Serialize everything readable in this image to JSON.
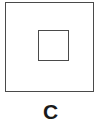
{
  "figure": {
    "caption": "C",
    "background_color": "#ffffff",
    "stroke_color": "#4a4a4a",
    "caption_color": "#1a1a1a",
    "shapes": [
      {
        "name": "outer-square",
        "type": "square",
        "x": 5,
        "y": 2,
        "width": 89,
        "height": 90,
        "stroke_width": 1.5,
        "fill": "none"
      },
      {
        "name": "inner-square",
        "type": "square",
        "x": 37,
        "y": 29,
        "width": 31,
        "height": 31,
        "stroke_width": 1.5,
        "fill": "none"
      }
    ]
  }
}
